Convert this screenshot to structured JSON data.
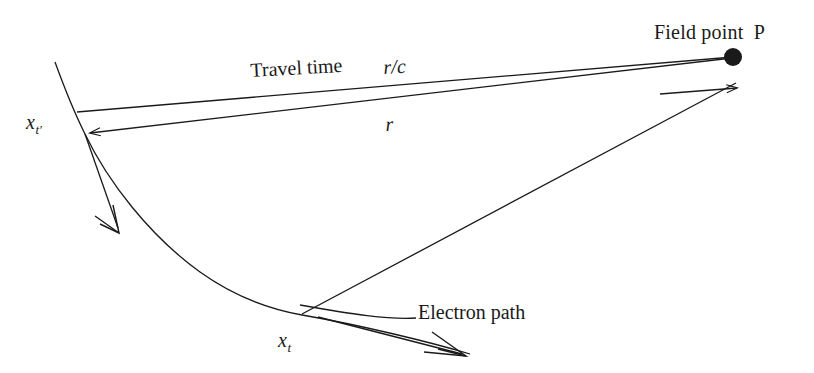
{
  "figure": {
    "background_color": "#ffffff",
    "stroke_color": "#1a1a1a",
    "width": 814,
    "height": 373
  },
  "labels": {
    "field_point": "Field point  P",
    "travel_time": "Travel time",
    "travel_time_value": "r/c",
    "distance": "r",
    "retarded_position": "x",
    "retarded_position_sub": "t",
    "retarded_position_prime": "′",
    "present_position": "x",
    "present_position_sub": "t",
    "electron_path": "Electron path"
  },
  "points": {
    "field_point_P": {
      "x": 733,
      "y": 57,
      "radius": 9,
      "filled": true
    },
    "x_t_prime": {
      "x": 85,
      "y": 134
    },
    "x_t": {
      "x": 302,
      "y": 313
    }
  },
  "elements": {
    "electron_path_curve": "curve from (55,62) through (85,134) and (200,255) to (302,313) continuing to (560,360)",
    "line_travel_time": "from x_t' upper node (77,112) to field point P (733,57)",
    "line_r": "from field point P (733,57) to x_t' (85,134), arrowhead at x_t'",
    "line_from_xt": "from x_t (302,313) through P up-right to arrow tip (743,89)",
    "velocity_arrow_xt_prime": "double-barbed arrow from (85,134) to (121,231)",
    "velocity_arrow_xt": "double-barbed arrow from (320,318) to (466,356)",
    "electron_path_leader": "leader line from label (418,318) curving left-down to curve at (300,312)"
  }
}
